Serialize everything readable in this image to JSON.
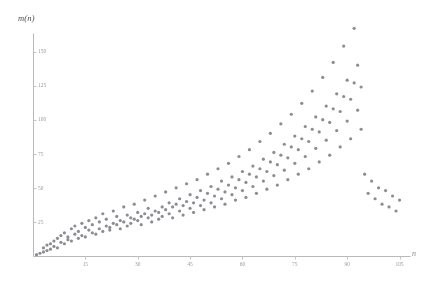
{
  "chart_data": {
    "type": "scatter",
    "title": "",
    "xlabel": "n",
    "ylabel": "m(n)",
    "grid": false,
    "legend": null,
    "xlim": [
      0,
      108
    ],
    "ylim": [
      0,
      168
    ],
    "xticks": [
      15,
      30,
      45,
      60,
      75,
      90,
      105
    ],
    "yticks": [
      25,
      50,
      75,
      100,
      125,
      150
    ],
    "marker": {
      "shape": "dot",
      "size": 1.6,
      "color": "#8c8c94"
    },
    "axis_color": "#b9b9bd",
    "points": [
      [
        1,
        1
      ],
      [
        2,
        2
      ],
      [
        3,
        3
      ],
      [
        3,
        6
      ],
      [
        4,
        4
      ],
      [
        4,
        8
      ],
      [
        5,
        5
      ],
      [
        5,
        9
      ],
      [
        6,
        7
      ],
      [
        6,
        11
      ],
      [
        7,
        6
      ],
      [
        7,
        13
      ],
      [
        8,
        10
      ],
      [
        8,
        15
      ],
      [
        9,
        9
      ],
      [
        9,
        17
      ],
      [
        10,
        12
      ],
      [
        10,
        14
      ],
      [
        11,
        11
      ],
      [
        11,
        20
      ],
      [
        12,
        16
      ],
      [
        12,
        22
      ],
      [
        13,
        13
      ],
      [
        13,
        18
      ],
      [
        14,
        15
      ],
      [
        14,
        24
      ],
      [
        15,
        14
      ],
      [
        15,
        21
      ],
      [
        16,
        19
      ],
      [
        16,
        26
      ],
      [
        17,
        17
      ],
      [
        17,
        23
      ],
      [
        18,
        16
      ],
      [
        18,
        28
      ],
      [
        19,
        20
      ],
      [
        19,
        25
      ],
      [
        20,
        18
      ],
      [
        20,
        31
      ],
      [
        21,
        22
      ],
      [
        21,
        27
      ],
      [
        22,
        21
      ],
      [
        22,
        19
      ],
      [
        23,
        24
      ],
      [
        23,
        33
      ],
      [
        24,
        23
      ],
      [
        24,
        29
      ],
      [
        25,
        26
      ],
      [
        25,
        20
      ],
      [
        26,
        25
      ],
      [
        26,
        36
      ],
      [
        27,
        22
      ],
      [
        27,
        30
      ],
      [
        28,
        28
      ],
      [
        28,
        24
      ],
      [
        29,
        27
      ],
      [
        29,
        38
      ],
      [
        30,
        26
      ],
      [
        30,
        32
      ],
      [
        31,
        29
      ],
      [
        31,
        23
      ],
      [
        32,
        31
      ],
      [
        32,
        41
      ],
      [
        33,
        28
      ],
      [
        33,
        35
      ],
      [
        34,
        30
      ],
      [
        34,
        25
      ],
      [
        35,
        33
      ],
      [
        35,
        44
      ],
      [
        36,
        32
      ],
      [
        36,
        27
      ],
      [
        37,
        36
      ],
      [
        37,
        29
      ],
      [
        38,
        34
      ],
      [
        38,
        47
      ],
      [
        39,
        31
      ],
      [
        39,
        39
      ],
      [
        40,
        36
      ],
      [
        40,
        28
      ],
      [
        41,
        38
      ],
      [
        41,
        50
      ],
      [
        42,
        33
      ],
      [
        42,
        42
      ],
      [
        43,
        37
      ],
      [
        43,
        30
      ],
      [
        44,
        40
      ],
      [
        44,
        53
      ],
      [
        45,
        35
      ],
      [
        45,
        45
      ],
      [
        46,
        39
      ],
      [
        46,
        32
      ],
      [
        47,
        43
      ],
      [
        47,
        56
      ],
      [
        48,
        37
      ],
      [
        48,
        48
      ],
      [
        49,
        41
      ],
      [
        49,
        34
      ],
      [
        50,
        46
      ],
      [
        50,
        60
      ],
      [
        51,
        39
      ],
      [
        51,
        51
      ],
      [
        52,
        44
      ],
      [
        52,
        36
      ],
      [
        53,
        49
      ],
      [
        53,
        64
      ],
      [
        54,
        42
      ],
      [
        54,
        55
      ],
      [
        55,
        47
      ],
      [
        55,
        38
      ],
      [
        56,
        52
      ],
      [
        56,
        68
      ],
      [
        57,
        45
      ],
      [
        57,
        58
      ],
      [
        58,
        50
      ],
      [
        58,
        41
      ],
      [
        59,
        56
      ],
      [
        59,
        73
      ],
      [
        60,
        48
      ],
      [
        60,
        62
      ],
      [
        61,
        54
      ],
      [
        61,
        43
      ],
      [
        62,
        60
      ],
      [
        62,
        78
      ],
      [
        63,
        51
      ],
      [
        63,
        66
      ],
      [
        64,
        58
      ],
      [
        64,
        46
      ],
      [
        65,
        64
      ],
      [
        65,
        84
      ],
      [
        66,
        55
      ],
      [
        66,
        71
      ],
      [
        67,
        62
      ],
      [
        67,
        49
      ],
      [
        68,
        69
      ],
      [
        68,
        90
      ],
      [
        69,
        59
      ],
      [
        69,
        76
      ],
      [
        70,
        67
      ],
      [
        70,
        52
      ],
      [
        71,
        74
      ],
      [
        71,
        97
      ],
      [
        72,
        63
      ],
      [
        72,
        82
      ],
      [
        73,
        72
      ],
      [
        73,
        56
      ],
      [
        74,
        80
      ],
      [
        74,
        104
      ],
      [
        75,
        68
      ],
      [
        75,
        88
      ],
      [
        76,
        78
      ],
      [
        76,
        60
      ],
      [
        77,
        86
      ],
      [
        77,
        112
      ],
      [
        78,
        73
      ],
      [
        78,
        95
      ],
      [
        79,
        84
      ],
      [
        79,
        64
      ],
      [
        80,
        93
      ],
      [
        80,
        121
      ],
      [
        81,
        79
      ],
      [
        81,
        102
      ],
      [
        82,
        91
      ],
      [
        82,
        69
      ],
      [
        83,
        100
      ],
      [
        83,
        131
      ],
      [
        84,
        85
      ],
      [
        84,
        110
      ],
      [
        85,
        98
      ],
      [
        85,
        74
      ],
      [
        86,
        108
      ],
      [
        86,
        142
      ],
      [
        87,
        92
      ],
      [
        87,
        119
      ],
      [
        88,
        106
      ],
      [
        88,
        80
      ],
      [
        89,
        117
      ],
      [
        89,
        154
      ],
      [
        90,
        99
      ],
      [
        90,
        129
      ],
      [
        91,
        115
      ],
      [
        91,
        86
      ],
      [
        92,
        127
      ],
      [
        92,
        167
      ],
      [
        93,
        107
      ],
      [
        93,
        140
      ],
      [
        94,
        124
      ],
      [
        94,
        93
      ],
      [
        95,
        60
      ],
      [
        96,
        46
      ],
      [
        97,
        55
      ],
      [
        98,
        42
      ],
      [
        99,
        50
      ],
      [
        100,
        38
      ],
      [
        101,
        48
      ],
      [
        102,
        36
      ],
      [
        103,
        44
      ],
      [
        104,
        33
      ],
      [
        105,
        41
      ]
    ]
  }
}
